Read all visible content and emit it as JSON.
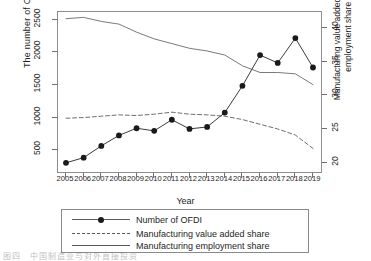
{
  "chart_data": {
    "type": "line",
    "title": "",
    "xlabel": "Year",
    "ylabel_left": "The number of OFDI",
    "ylabel_right": "Manufacturing value added share and employment share (%)",
    "x": [
      2005,
      2006,
      2007,
      2008,
      2009,
      2010,
      2011,
      2012,
      2013,
      2014,
      2015,
      2016,
      2017,
      2018,
      2019
    ],
    "xticklabels": [
      "2005",
      "2006",
      "2007",
      "2008",
      "2009",
      "2010",
      "2011",
      "2012",
      "2013",
      "2014",
      "2015",
      "2016",
      "2017",
      "2018",
      "2019"
    ],
    "yticklabels_left": [
      "500",
      "1000",
      "1500",
      "2000",
      "2500"
    ],
    "ytickvalues_left": [
      500,
      1000,
      1500,
      2000,
      2500
    ],
    "ylim_left": [
      170,
      2620
    ],
    "yticklabels_right": [
      "20",
      "25",
      "30",
      "35",
      "40"
    ],
    "ytickvalues_right": [
      20,
      25,
      30,
      35,
      40
    ],
    "ylim_right": [
      18.6,
      42.4
    ],
    "grid": false,
    "legend_position": "below-axes",
    "series": [
      {
        "name": "Number of OFDI",
        "axis": "left",
        "style": "solid-with-markers",
        "marker": "filled-circle",
        "color": "#3c3c3c",
        "values": [
          310,
          390,
          570,
          730,
          840,
          800,
          970,
          830,
          860,
          1080,
          1490,
          1960,
          1840,
          2220,
          1770
        ]
      },
      {
        "name": "Manufacturing value added share",
        "axis": "right",
        "style": "dashed",
        "color": "#6e6e6e",
        "values": [
          26.6,
          26.7,
          26.9,
          27.1,
          27.0,
          27.2,
          27.5,
          27.2,
          27.1,
          26.9,
          26.4,
          25.7,
          25.0,
          24.1,
          22.1
        ]
      },
      {
        "name": "Manufacturing employment share",
        "axis": "right",
        "style": "solid",
        "color": "#7a7a7a",
        "values": [
          41.4,
          41.6,
          41.0,
          40.6,
          39.4,
          38.4,
          37.7,
          37.0,
          36.6,
          36.0,
          34.4,
          33.4,
          33.4,
          33.2,
          31.6
        ]
      }
    ]
  },
  "legend": {
    "items": [
      {
        "label": "Number of OFDI",
        "key": "solid-marker"
      },
      {
        "label": "Manufacturing value added share",
        "key": "dashed"
      },
      {
        "label": "Manufacturing employment share",
        "key": "solid"
      }
    ]
  },
  "footer": {
    "caption": "图四　中国制造业与对外直接投资"
  }
}
